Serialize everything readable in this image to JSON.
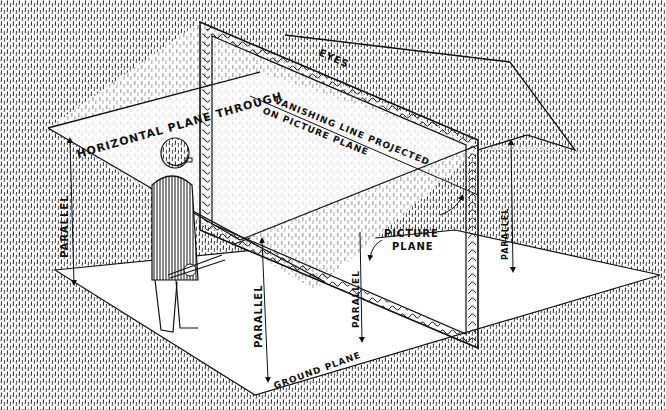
{
  "diagram": {
    "labels": {
      "horizontal_plane": "HORIZONTAL PLANE THROUGH",
      "eyes": "EYES",
      "vanishing_line_1": "VANISHING LINE PROJECTED",
      "vanishing_line_2": "ON PICTURE PLANE",
      "picture_plane_1": "PICTURE",
      "picture_plane_2": "PLANE",
      "ground_plane": "GROUND PLANE",
      "parallel_left": "PARALLEL",
      "parallel_center_left": "PARALLEL",
      "parallel_center_right": "PARALLEL",
      "parallel_right": "PARALLEL"
    },
    "figures": [
      "artist-with-brushes",
      "picture-frame"
    ],
    "colors": {
      "ink": "#111111",
      "paper": "#ffffff"
    }
  }
}
